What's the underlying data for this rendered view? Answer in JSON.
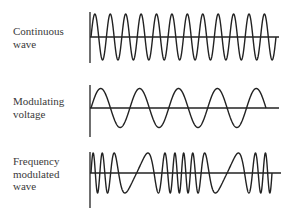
{
  "figure": {
    "panels": [
      {
        "id": "continuous",
        "label_lines": [
          "Continuous",
          "wave"
        ],
        "cycles": 12,
        "type": "carrier"
      },
      {
        "id": "modulating",
        "label_lines": [
          "Modulating",
          "voltage"
        ],
        "cycles": 4.5,
        "type": "modulating"
      },
      {
        "id": "fm",
        "label_lines": [
          "Frequency",
          "modulated",
          "wave"
        ],
        "type": "frequency-modulated"
      }
    ]
  },
  "chart_data": [
    {
      "type": "line",
      "title": "Continuous wave",
      "description": "Constant-frequency sinusoidal carrier, ~12 cycles, constant amplitude",
      "xlabel": "",
      "ylabel": "",
      "grid": false
    },
    {
      "type": "line",
      "title": "Modulating voltage",
      "description": "Low-frequency sine wave, ~4.5 cycles",
      "xlabel": "",
      "ylabel": "",
      "grid": false
    },
    {
      "type": "line",
      "title": "Frequency modulated wave",
      "description": "Carrier whose frequency varies with modulating voltage: compressed (higher freq) and stretched (lower freq) regions",
      "xlabel": "",
      "ylabel": "",
      "grid": false
    }
  ]
}
